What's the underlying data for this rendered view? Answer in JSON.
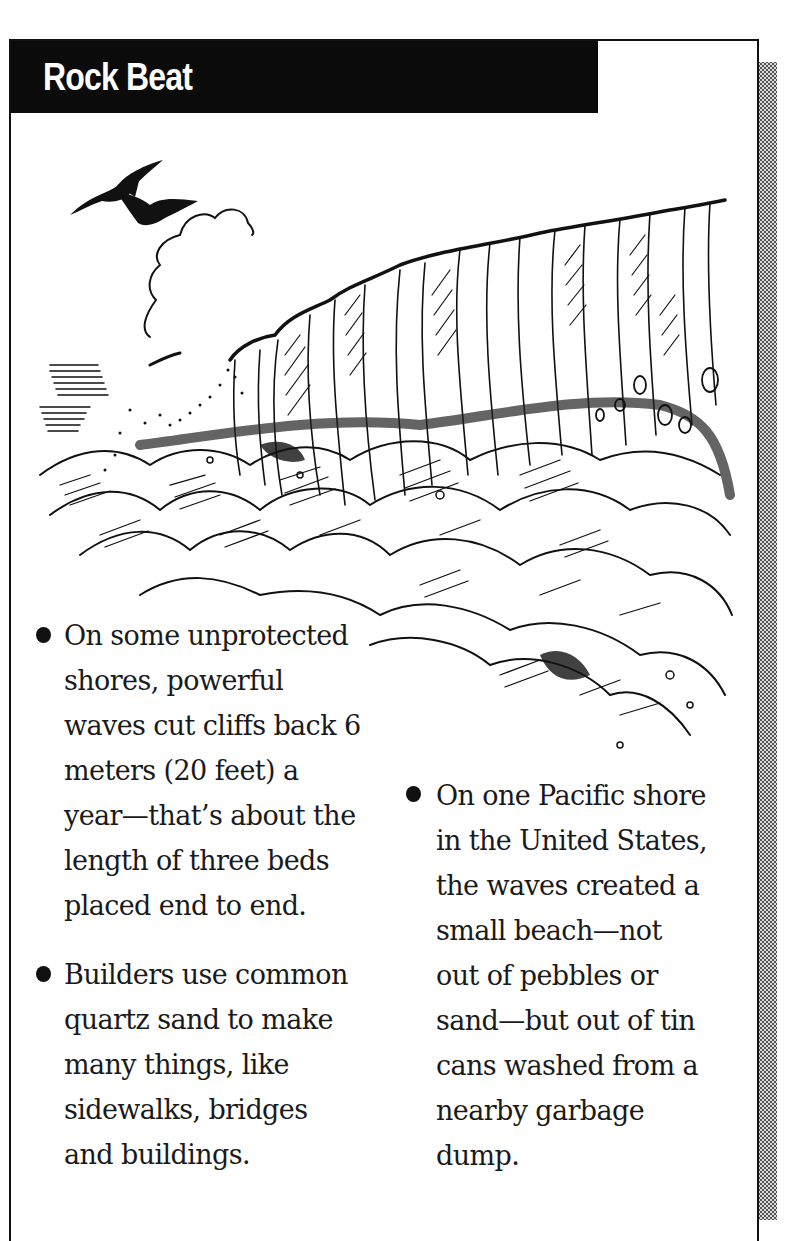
{
  "header": {
    "title": "Rock Beat"
  },
  "illustration": {
    "subject": "sea-cliff-with-waves-and-birds-illustration"
  },
  "facts": [
    {
      "lines": [
        "On some unprotected",
        "shores, powerful",
        "waves cut cliffs back 6",
        "meters (20 feet) a",
        "year—that’s about the",
        "length of three beds",
        "placed end to end."
      ]
    },
    {
      "lines": [
        "Builders use common",
        "quartz sand to make",
        "many things, like",
        "sidewalks, bridges",
        "and buildings."
      ]
    },
    {
      "lines": [
        "On one Pacific shore",
        "in the United States,",
        "the waves created a",
        "small beach—not",
        "out of pebbles or",
        "sand—but out of tin",
        "cans washed from a",
        "nearby garbage",
        "dump."
      ]
    }
  ],
  "colors": {
    "header_bg": "#0b0b0b",
    "header_text": "#ffffff",
    "text": "#1a1a1a",
    "frame": "#111111"
  }
}
